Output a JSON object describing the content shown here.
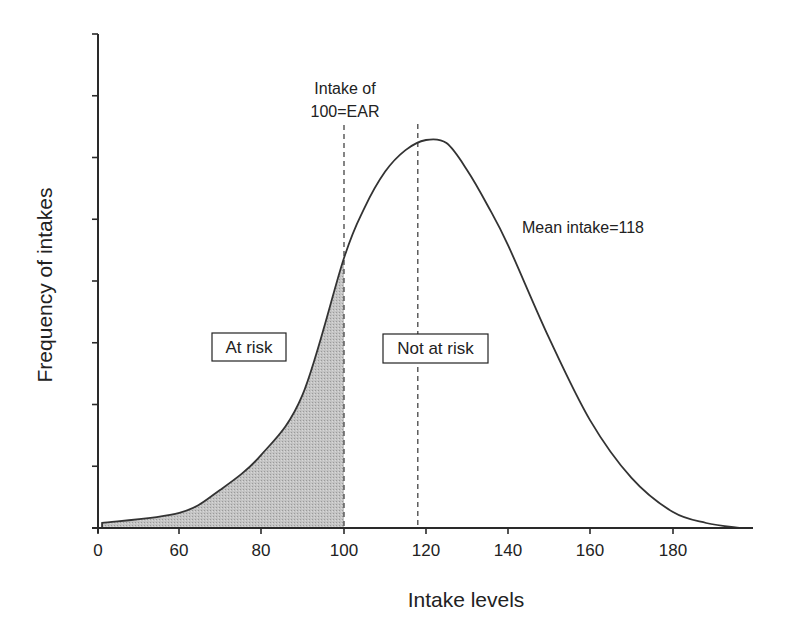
{
  "chart_data": {
    "type": "area",
    "title": "",
    "xlabel": "Intake levels",
    "ylabel": "Frequency of intakes",
    "x_ticks": [
      {
        "value": 0,
        "label": "0",
        "px": 98
      },
      {
        "value": 60,
        "label": "60",
        "px": 179
      },
      {
        "value": 80,
        "label": "80",
        "px": 261
      },
      {
        "value": 100,
        "label": "100",
        "px": 344
      },
      {
        "value": 120,
        "label": "120",
        "px": 426
      },
      {
        "value": 140,
        "label": "140",
        "px": 508
      },
      {
        "value": 160,
        "label": "160",
        "px": 590
      },
      {
        "value": 180,
        "label": "180",
        "px": 673
      }
    ],
    "y_tick_count": 8,
    "y_ticks_labeled": false,
    "grid": false,
    "series": [
      {
        "name": "Distribution of usual intakes",
        "x": [
          3,
          60,
          70,
          80,
          90,
          100,
          105,
          110,
          115,
          120,
          125,
          130,
          135,
          140,
          150,
          160,
          170,
          180,
          188,
          196
        ],
        "values": [
          0.013,
          0.039,
          0.098,
          0.188,
          0.343,
          0.696,
          0.825,
          0.918,
          0.974,
          1.0,
          0.992,
          0.923,
          0.832,
          0.729,
          0.49,
          0.278,
          0.129,
          0.041,
          0.013,
          0.0
        ]
      }
    ],
    "shaded_region": {
      "from": 3,
      "to": 100,
      "label": "At risk",
      "color": "#bdbdbd"
    },
    "reference_lines": [
      {
        "x": 100,
        "label": "Intake of 100=EAR",
        "style": "dashed"
      },
      {
        "x": 118,
        "label": "Mean intake=118",
        "style": "dashed"
      }
    ],
    "annotations": [
      {
        "text": "At risk",
        "boxed": true
      },
      {
        "text": "Not at risk",
        "boxed": true
      },
      {
        "text": "Mean intake=118",
        "boxed": false
      }
    ]
  },
  "labels": {
    "xlabel": "Intake levels",
    "ylabel": "Frequency of intakes",
    "ear_line1": "Intake of",
    "ear_line2": "100=EAR",
    "mean_label": "Mean intake=118",
    "at_risk": "At risk",
    "not_at_risk": "Not at risk"
  },
  "colors": {
    "axis": "#2a2a2a",
    "curve": "#333333",
    "shade": "#bdbdbd",
    "dash": "#444444"
  }
}
